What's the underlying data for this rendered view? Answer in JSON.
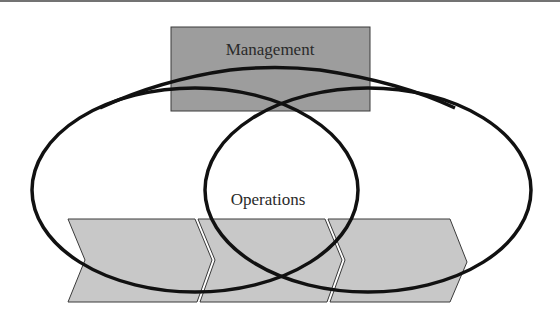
{
  "diagram": {
    "top_box": {
      "label": "Management",
      "fill": "#9a9a9a"
    },
    "center_label": "Operations",
    "value_chain": {
      "segments": 3,
      "fill": "#c8c8c8"
    },
    "ellipses": [
      "left-circle",
      "right-circle"
    ]
  }
}
